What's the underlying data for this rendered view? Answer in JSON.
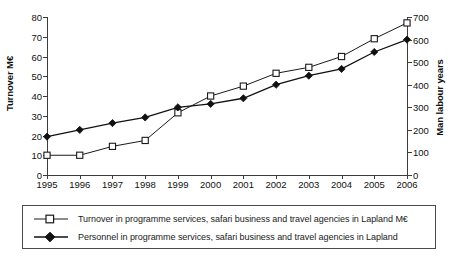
{
  "chart_data": {
    "type": "line",
    "title": "",
    "xlabel": "",
    "categories": [
      "1995",
      "1996",
      "1997",
      "1998",
      "1999",
      "2000",
      "2001",
      "2002",
      "2003",
      "2004",
      "2005",
      "2006"
    ],
    "grid": false,
    "legend_position": "bottom",
    "axes": {
      "left": {
        "label": "Turnover M€",
        "ticks": [
          0,
          10,
          20,
          30,
          40,
          50,
          60,
          70,
          80
        ],
        "lim": [
          0,
          80
        ]
      },
      "right": {
        "label": "Man labour years",
        "ticks": [
          0,
          100,
          200,
          300,
          400,
          500,
          600,
          700
        ],
        "lim": [
          0,
          700
        ]
      }
    },
    "series": [
      {
        "name": "Turnover in programme services, safari business and travel agencies in Lapland M€",
        "axis": "left",
        "marker": "open-square",
        "color": "#1a1a1a",
        "values": [
          10,
          10,
          14.5,
          17.5,
          31.5,
          40,
          45,
          51.5,
          54.5,
          60,
          69,
          77
        ]
      },
      {
        "name": "Personnel in programme services, safari business and travel agencies in Lapland",
        "axis": "right",
        "marker": "filled-diamond",
        "color": "#111111",
        "values": [
          170,
          200,
          230,
          255,
          300,
          315,
          340,
          400,
          440,
          470,
          545,
          600
        ]
      }
    ]
  },
  "legend": {
    "items": [
      {
        "marker": "open-square",
        "label": "Turnover in programme services, safari business and travel agencies in Lapland M€"
      },
      {
        "marker": "filled-diamond",
        "label": "Personnel in programme services, safari business and travel agencies in Lapland"
      }
    ]
  },
  "colors": {
    "line": "#1a1a1a",
    "axis": "#3c3c3c",
    "background": "#ffffff",
    "legend_border": "#4a4a4a"
  }
}
